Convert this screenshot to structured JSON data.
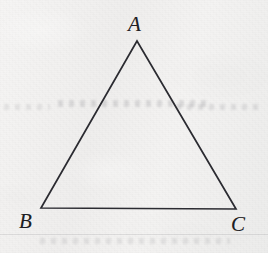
{
  "figure": {
    "kind": "geometry-diagram",
    "shape": "triangle",
    "background_color": "#f3f2f1",
    "stroke_color": "#2b2b31",
    "stroke_width": 1.7,
    "label_color": "#1f1f24",
    "canvas": {
      "width": 268,
      "height": 253
    },
    "vertices": [
      {
        "id": "A",
        "label": "A",
        "x": 137,
        "y": 41,
        "label_x": 128,
        "label_y": 14,
        "label_position": "above"
      },
      {
        "id": "B",
        "label": "B",
        "x": 41,
        "y": 208,
        "label_x": 19,
        "label_y": 211,
        "label_position": "below-left"
      },
      {
        "id": "C",
        "label": "C",
        "x": 236,
        "y": 209,
        "label_x": 231,
        "label_y": 214,
        "label_position": "below-right"
      }
    ],
    "edges": [
      {
        "id": "AB",
        "from": "A",
        "to": "B"
      },
      {
        "id": "BC",
        "from": "B",
        "to": "C"
      },
      {
        "id": "CA",
        "from": "C",
        "to": "A"
      }
    ]
  }
}
